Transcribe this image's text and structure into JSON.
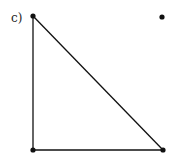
{
  "figure": {
    "label": "c)",
    "points": [
      {
        "name": "top-left",
        "x": 33,
        "y": 16
      },
      {
        "name": "top-right",
        "x": 162,
        "y": 17
      },
      {
        "name": "bottom-left",
        "x": 33,
        "y": 150
      },
      {
        "name": "bottom-right",
        "x": 163,
        "y": 150
      }
    ],
    "edges": [
      [
        "top-left",
        "bottom-left"
      ],
      [
        "bottom-left",
        "bottom-right"
      ],
      [
        "top-left",
        "bottom-right"
      ]
    ],
    "color": "#111111"
  }
}
